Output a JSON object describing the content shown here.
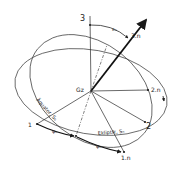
{
  "diagram": {
    "type": "coordinate-system-diagram",
    "center": {
      "label": "Gz",
      "x": 91,
      "y": 91
    },
    "colors": {
      "line": "#2a2a2a",
      "background": "#ffffff"
    },
    "axes": [
      {
        "id": "3",
        "label": "3",
        "end": {
          "x": 90,
          "y": 16
        },
        "style": "thin"
      },
      {
        "id": "3n",
        "label": "3.n",
        "end": {
          "x": 148,
          "y": 18
        },
        "style": "bold-arrow"
      },
      {
        "id": "2n",
        "label": "2.n",
        "end": {
          "x": 148,
          "y": 90
        },
        "style": "thin"
      },
      {
        "id": "2",
        "label": "2",
        "end": {
          "x": 145,
          "y": 122
        },
        "style": "thin"
      },
      {
        "id": "1",
        "label": "1",
        "end": {
          "x": 37,
          "y": 124
        },
        "style": "thin"
      },
      {
        "id": "1n",
        "label": "1.n",
        "end": {
          "x": 124,
          "y": 152
        },
        "style": "thin"
      }
    ],
    "planes": [
      {
        "name": "Äquator",
        "label": "Äquator, S₀"
      },
      {
        "name": "Ekliptik",
        "label": "Ekliptik, Sₙ"
      }
    ],
    "angles": [
      {
        "symbol": "εₙ",
        "label": "εₙ",
        "between": [
          "3",
          "3.n"
        ]
      },
      {
        "symbol": "ψₙ",
        "label": "ψₙ",
        "between": [
          "1",
          "node"
        ]
      },
      {
        "symbol": "φₙ",
        "label": "φₙ",
        "between": [
          "node",
          "1.n"
        ]
      }
    ]
  }
}
